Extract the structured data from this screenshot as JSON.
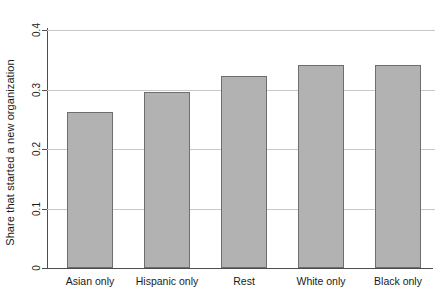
{
  "chart_data": {
    "type": "bar",
    "title": "",
    "xlabel": "",
    "ylabel": "Share that started a new organization",
    "categories": [
      "Asian only",
      "Hispanic only",
      "Rest",
      "White only",
      "Black only"
    ],
    "values": [
      0.262,
      0.295,
      0.322,
      0.342,
      0.342
    ],
    "ylim": [
      0,
      0.42
    ],
    "yticks": [
      0,
      0.1,
      0.2,
      0.3,
      0.4
    ],
    "ytick_labels": [
      "0",
      "0.1",
      "0.2",
      "0.3",
      "0.4"
    ],
    "grid": true,
    "grid_axis": "y",
    "legend": null,
    "bar_fill_color": "#b2b2b2",
    "bar_edge_color": "#6e6e6e",
    "grid_color": "#c8c8c8",
    "axis_color": "#4d4d4d"
  },
  "axis": {
    "y_title": "Share that started a new organization"
  }
}
